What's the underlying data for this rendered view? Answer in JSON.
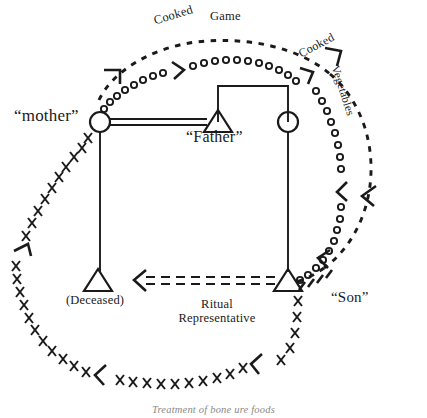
{
  "figure": {
    "caption": "Treatment of bone ure foods",
    "background_color": "#ffffff",
    "ink_color": "#1a1a1a"
  },
  "nodes": {
    "mother": {
      "label": "“mother”",
      "shape": "circle",
      "x": 100,
      "y": 122
    },
    "father": {
      "label": "“Father”",
      "shape": "triangle",
      "x": 218,
      "y": 122
    },
    "fathers_sister": {
      "label": "",
      "shape": "circle",
      "x": 288,
      "y": 122
    },
    "deceased": {
      "label": "(Deceased)",
      "shape": "triangle",
      "x": 98,
      "y": 281
    },
    "son": {
      "label": "“Son”",
      "shape": "triangle",
      "x": 288,
      "y": 281
    }
  },
  "flows": {
    "cooked_game": {
      "word_1": "Cooked",
      "word_2": "Game",
      "marker": "circle-path"
    },
    "cooked": {
      "label": "Cooked",
      "marker": "dash-path"
    },
    "vegetables": {
      "label": "Vegetables",
      "marker": "dash-path"
    },
    "ritual_representative": {
      "line_1": "Ritual",
      "line_2": "Representative",
      "marker": "double-dashed-arrow"
    },
    "bone_ure": {
      "marker": "x-path"
    }
  },
  "legend_marks": {
    "circle_marker": "o",
    "cross_marker": "×",
    "dash_marker": "/"
  }
}
